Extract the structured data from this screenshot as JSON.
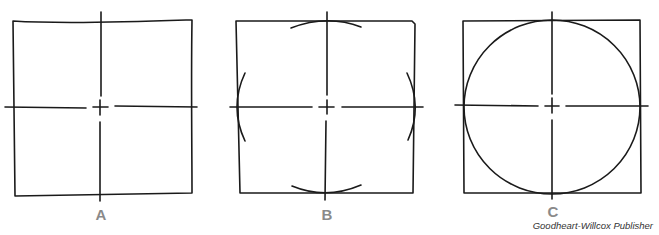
{
  "figure": {
    "panels": [
      {
        "id": "A",
        "label": "A",
        "description": "Square with center lines"
      },
      {
        "id": "B",
        "label": "B",
        "description": "Square with center lines and arcs at midpoints"
      },
      {
        "id": "C",
        "label": "C",
        "description": "Circle inscribed in square with center lines"
      }
    ],
    "credit": "Goodheart-Willcox Publisher",
    "colors": {
      "line": "#1a1a1a",
      "label": "#8a8a8a",
      "credit": "#333333",
      "background": "#ffffff"
    }
  }
}
